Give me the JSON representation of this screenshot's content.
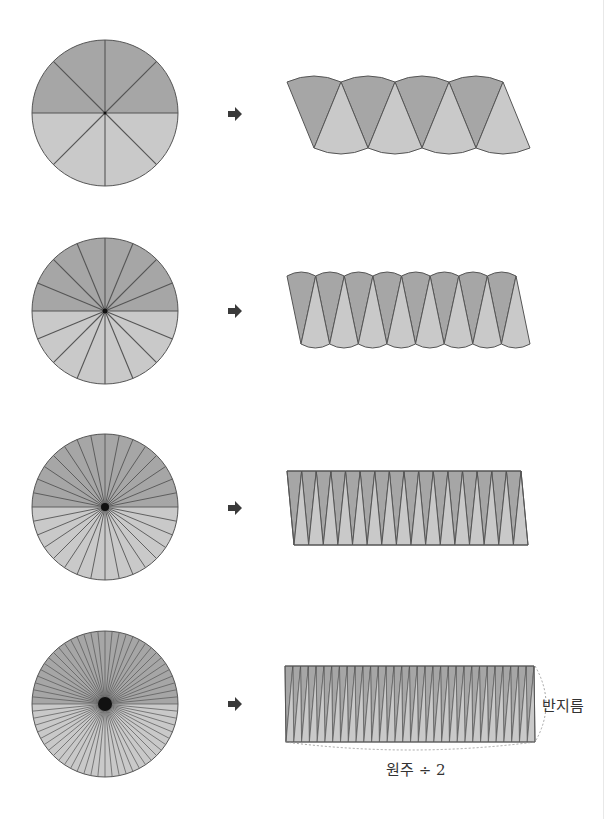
{
  "colors": {
    "dark_fill": "#a6a6a6",
    "light_fill": "#c9c9c9",
    "stroke": "#555555",
    "arrow": "#3a3a3a",
    "dashed": "#9a9a9a"
  },
  "rows": [
    {
      "sectors": 8,
      "circle": {
        "cx": 105,
        "cy": 113,
        "r": 73
      },
      "shape": {
        "x0": 287,
        "x1": 530,
        "top": 82,
        "bottom": 148,
        "curved": true,
        "shear": 27
      },
      "arrow": {
        "x": 228,
        "y": 114
      }
    },
    {
      "sectors": 16,
      "circle": {
        "cx": 105,
        "cy": 311,
        "r": 73
      },
      "shape": {
        "x0": 287,
        "x1": 530,
        "top": 276,
        "bottom": 344,
        "curved": true,
        "shear": 14
      },
      "arrow": {
        "x": 228,
        "y": 311
      }
    },
    {
      "sectors": 32,
      "circle": {
        "cx": 105,
        "cy": 507,
        "r": 73
      },
      "shape": {
        "x0": 287,
        "x1": 528,
        "top": 471,
        "bottom": 545,
        "curved": false,
        "shear": 7
      },
      "arrow": {
        "x": 228,
        "y": 508
      }
    },
    {
      "sectors": 64,
      "circle": {
        "cx": 105,
        "cy": 704,
        "r": 73
      },
      "shape": {
        "x0": 285,
        "x1": 535,
        "top": 666,
        "bottom": 742,
        "curved": false,
        "shear": 1
      },
      "arrow": {
        "x": 228,
        "y": 704
      }
    }
  ],
  "labels": {
    "radius": "반지름",
    "half_circumference": "원주 ÷ 2"
  }
}
